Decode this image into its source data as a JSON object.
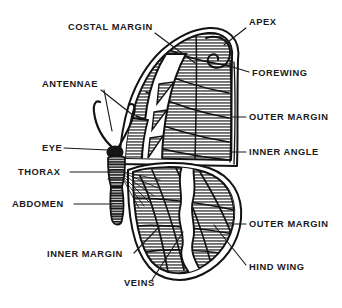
{
  "figure": {
    "view": "dorsal, left half",
    "background_color": "#ffffff",
    "ink_color": "#121212",
    "wing_fill_color": "#8f8f8f",
    "wing_highlight_color": "#ffffff",
    "style": "line-hatched halftone engraving"
  },
  "labels": [
    {
      "id": "costal-margin",
      "text": "COSTAL MARGIN",
      "x": 68,
      "y": 30,
      "anchor": "start",
      "leader": "M 155 33 L 195 63"
    },
    {
      "id": "apex",
      "text": "APEX",
      "x": 249,
      "y": 25,
      "anchor": "start",
      "leader": "M 246 28 L 224 45"
    },
    {
      "id": "antennae",
      "text": "ANTENNAE",
      "x": 42,
      "y": 87,
      "anchor": "start",
      "leader": "M 101 90 L 134 116 M 104 90 L 112 131"
    },
    {
      "id": "forewing",
      "text": "FOREWING",
      "x": 252,
      "y": 76,
      "anchor": "start",
      "leader": "M 249 72 L 226 65"
    },
    {
      "id": "outer-margin-fore",
      "text": "OUTER MARGIN",
      "x": 249,
      "y": 120,
      "anchor": "start",
      "leader": "M 246 117 L 231 117"
    },
    {
      "id": "eye",
      "text": "EYE",
      "x": 42,
      "y": 151,
      "anchor": "start",
      "leader": "M 64 148 L 108 150"
    },
    {
      "id": "inner-angle",
      "text": "INNER ANGLE",
      "x": 249,
      "y": 155,
      "anchor": "start",
      "leader": "M 246 152 L 232 152"
    },
    {
      "id": "thorax",
      "text": "THORAX",
      "x": 18,
      "y": 175,
      "anchor": "start",
      "leader": "M 70 172 L 110 172"
    },
    {
      "id": "abdomen",
      "text": "ABDOMEN",
      "x": 12,
      "y": 207,
      "anchor": "start",
      "leader": "M 74 204 L 112 204"
    },
    {
      "id": "outer-margin-hind",
      "text": "OUTER MARGIN",
      "x": 249,
      "y": 227,
      "anchor": "start",
      "leader": "M 246 224 L 228 224"
    },
    {
      "id": "inner-margin",
      "text": "INNER MARGIN",
      "x": 47,
      "y": 257,
      "anchor": "start",
      "leader": "M 134 253 L 160 226"
    },
    {
      "id": "veins",
      "text": "VEINS",
      "x": 124,
      "y": 286,
      "anchor": "start",
      "leader": "M 152 280 L 183 232"
    },
    {
      "id": "hind-wing",
      "text": "HIND WING",
      "x": 249,
      "y": 270,
      "anchor": "start",
      "leader": "M 246 265 L 214 225"
    }
  ],
  "parts": {
    "forewing": "forewing",
    "hind_wing": "hind wing",
    "thorax": "thorax",
    "abdomen": "abdomen",
    "eye": "eye",
    "antennae": "antennae",
    "veins": "veins",
    "costal_margin": "costal margin",
    "outer_margin": "outer margin",
    "inner_margin": "inner margin",
    "inner_angle": "inner angle",
    "apex": "apex"
  }
}
